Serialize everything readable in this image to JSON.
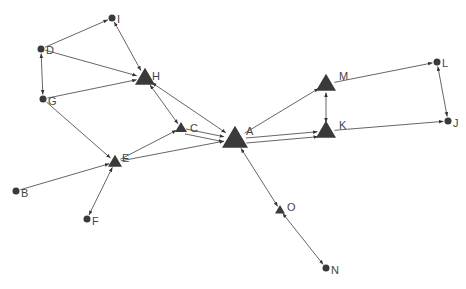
{
  "diagram": {
    "type": "directed-network-graph",
    "colors": {
      "node": "#3a3a3a",
      "edge": "#555555",
      "label": "#444444",
      "background": "#ffffff"
    },
    "nodes": [
      {
        "id": "A",
        "label": "A",
        "shape": "triangle",
        "size": 13,
        "x": 235,
        "y": 139,
        "lx": 246,
        "ly": 135
      },
      {
        "id": "B",
        "label": "B",
        "shape": "circle",
        "size": 3.5,
        "x": 16,
        "y": 191,
        "lx": 21,
        "ly": 197
      },
      {
        "id": "C",
        "label": "C",
        "shape": "triangle",
        "size": 6,
        "x": 181,
        "y": 128,
        "lx": 190,
        "ly": 132
      },
      {
        "id": "D",
        "label": "D",
        "shape": "circle",
        "size": 3.5,
        "x": 41,
        "y": 49,
        "lx": 46,
        "ly": 54
      },
      {
        "id": "E",
        "label": "E",
        "shape": "triangle",
        "size": 7,
        "x": 115,
        "y": 162,
        "lx": 122,
        "ly": 162
      },
      {
        "id": "F",
        "label": "F",
        "shape": "circle",
        "size": 3.5,
        "x": 87,
        "y": 219,
        "lx": 92,
        "ly": 225
      },
      {
        "id": "G",
        "label": "G",
        "shape": "circle",
        "size": 3.5,
        "x": 43,
        "y": 99,
        "lx": 48,
        "ly": 105
      },
      {
        "id": "H",
        "label": "H",
        "shape": "triangle",
        "size": 10,
        "x": 145,
        "y": 78,
        "lx": 152,
        "ly": 80
      },
      {
        "id": "I",
        "label": "I",
        "shape": "circle",
        "size": 3.5,
        "x": 112,
        "y": 18,
        "lx": 117,
        "ly": 23
      },
      {
        "id": "J",
        "label": "J",
        "shape": "circle",
        "size": 3.5,
        "x": 448,
        "y": 121,
        "lx": 453,
        "ly": 127
      },
      {
        "id": "K",
        "label": "K",
        "shape": "triangle",
        "size": 10,
        "x": 326,
        "y": 131,
        "lx": 339,
        "ly": 129
      },
      {
        "id": "L",
        "label": "L",
        "shape": "circle",
        "size": 3.5,
        "x": 437,
        "y": 62,
        "lx": 442,
        "ly": 67
      },
      {
        "id": "M",
        "label": "M",
        "shape": "triangle",
        "size": 10,
        "x": 326,
        "y": 84,
        "lx": 339,
        "ly": 80
      },
      {
        "id": "N",
        "label": "N",
        "shape": "circle",
        "size": 3.5,
        "x": 326,
        "y": 268,
        "lx": 331,
        "ly": 274
      },
      {
        "id": "O",
        "label": "O",
        "shape": "triangle",
        "size": 5,
        "x": 280,
        "y": 210,
        "lx": 287,
        "ly": 211
      }
    ],
    "edges": [
      {
        "from": "D",
        "to": "I",
        "arrow": "end"
      },
      {
        "from": "D",
        "to": "G",
        "arrow": "both"
      },
      {
        "from": "D",
        "to": "H",
        "arrow": "end"
      },
      {
        "from": "G",
        "to": "H",
        "arrow": "end"
      },
      {
        "from": "I",
        "to": "H",
        "arrow": "both"
      },
      {
        "from": "G",
        "to": "E",
        "arrow": "end"
      },
      {
        "from": "H",
        "to": "C",
        "arrow": "both"
      },
      {
        "from": "H",
        "to": "A",
        "arrow": "both"
      },
      {
        "from": "C",
        "to": "A",
        "arrow": "end"
      },
      {
        "from": "C",
        "to": "A",
        "arrow": "end",
        "offset": 5
      },
      {
        "from": "E",
        "to": "C",
        "arrow": "end"
      },
      {
        "from": "E",
        "to": "A",
        "arrow": "end"
      },
      {
        "from": "B",
        "to": "E",
        "arrow": "end"
      },
      {
        "from": "E",
        "to": "F",
        "arrow": "both"
      },
      {
        "from": "A",
        "to": "M",
        "arrow": "end"
      },
      {
        "from": "A",
        "to": "K",
        "arrow": "end"
      },
      {
        "from": "A",
        "to": "K",
        "arrow": "end",
        "offset": 5
      },
      {
        "from": "M",
        "to": "K",
        "arrow": "both"
      },
      {
        "from": "M",
        "to": "L",
        "arrow": "end"
      },
      {
        "from": "K",
        "to": "J",
        "arrow": "end"
      },
      {
        "from": "L",
        "to": "J",
        "arrow": "both"
      },
      {
        "from": "A",
        "to": "O",
        "arrow": "both"
      },
      {
        "from": "O",
        "to": "N",
        "arrow": "both"
      }
    ]
  }
}
